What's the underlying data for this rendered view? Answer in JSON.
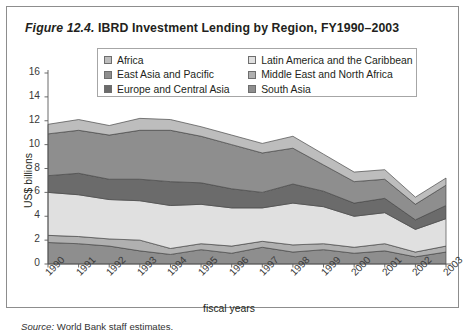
{
  "figure": {
    "label": "Figure 12.4.",
    "title": "IBRD Investment Lending by Region, FY1990–2003",
    "source_prefix": "Source:",
    "source_text": "World Bank staff estimates."
  },
  "legend": {
    "entries": [
      {
        "label": "Africa",
        "color": "#bdbdbd"
      },
      {
        "label": "Latin America and the Caribbean",
        "color": "#e0e0e0"
      },
      {
        "label": "East Asia and Pacific",
        "color": "#8e8e8e"
      },
      {
        "label": "Middle East and North Africa",
        "color": "#b0b0b0"
      },
      {
        "label": "Europe and Central Asia",
        "color": "#6b6b6b"
      },
      {
        "label": "South Asia",
        "color": "#8e8e8e"
      }
    ]
  },
  "chart_data": {
    "type": "area",
    "stacked": true,
    "title": "IBRD Investment Lending by Region, FY1990–2003",
    "xlabel": "fiscal years",
    "ylabel": "US$ billions",
    "ylim": [
      0,
      16
    ],
    "yticks": [
      0,
      2,
      4,
      6,
      8,
      10,
      12,
      14,
      16
    ],
    "grid": false,
    "legend_position": "top",
    "categories": [
      "1990",
      "1991",
      "1992",
      "1993",
      "1994",
      "1995",
      "1996",
      "1997",
      "1998",
      "1999",
      "2000",
      "2001",
      "2002",
      "2003"
    ],
    "stack_order_bottom_to_top": [
      "South Asia",
      "Middle East and North Africa",
      "Latin America and the Caribbean",
      "Europe and Central Asia",
      "East Asia and Pacific",
      "Africa"
    ],
    "series": [
      {
        "name": "South Asia",
        "color": "#8e8e8e",
        "values": [
          1.8,
          1.7,
          1.5,
          1.1,
          0.8,
          1.2,
          0.9,
          1.4,
          1.0,
          1.2,
          0.9,
          1.1,
          0.6,
          1.0
        ]
      },
      {
        "name": "Middle East and North Africa",
        "color": "#b0b0b0",
        "values": [
          0.6,
          0.6,
          0.6,
          0.9,
          0.5,
          0.5,
          0.6,
          0.5,
          0.6,
          0.5,
          0.5,
          0.6,
          0.4,
          0.5
        ]
      },
      {
        "name": "Latin America and the Caribbean",
        "color": "#e0e0e0",
        "values": [
          3.6,
          3.5,
          3.3,
          3.3,
          3.6,
          3.3,
          3.2,
          2.8,
          3.5,
          3.1,
          2.6,
          2.6,
          1.9,
          2.3
        ]
      },
      {
        "name": "Europe and Central Asia",
        "color": "#6b6b6b",
        "values": [
          1.4,
          1.8,
          1.7,
          1.8,
          2.0,
          1.8,
          1.6,
          1.3,
          1.6,
          1.3,
          1.1,
          1.2,
          0.8,
          1.1
        ]
      },
      {
        "name": "East Asia and Pacific",
        "color": "#8e8e8e",
        "values": [
          3.5,
          3.6,
          3.7,
          4.1,
          4.3,
          3.9,
          3.7,
          3.3,
          3.0,
          2.2,
          1.8,
          1.6,
          1.3,
          1.7
        ]
      },
      {
        "name": "Africa",
        "color": "#bdbdbd",
        "values": [
          0.8,
          0.9,
          0.8,
          1.0,
          0.9,
          0.8,
          0.8,
          0.8,
          1.0,
          0.9,
          0.8,
          0.8,
          0.6,
          0.6
        ]
      }
    ],
    "totals": [
      11.7,
      12.1,
      11.6,
      12.2,
      12.1,
      11.5,
      10.8,
      10.1,
      10.7,
      9.2,
      7.7,
      7.9,
      5.6,
      7.2
    ]
  }
}
